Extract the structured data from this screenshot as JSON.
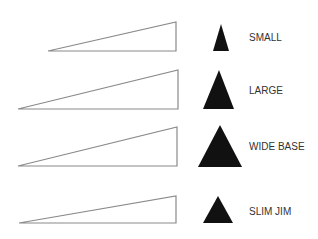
{
  "colors": {
    "background": "#ffffff",
    "outline_stroke": "#8a8a8a",
    "solid_fill": "#111111",
    "label_text": "#333333"
  },
  "rows": [
    {
      "label": "SMALL",
      "outline_triangle": {
        "points": "48,51 176,22 176,51"
      },
      "solid_triangle": {
        "points": "221,24 213,51 229,51"
      },
      "label_pos": {
        "x": 249,
        "y": 33
      }
    },
    {
      "label": "LARGE",
      "outline_triangle": {
        "points": "18,109 178,70 178,109"
      },
      "solid_triangle": {
        "points": "219,70 203,109 234,109"
      },
      "label_pos": {
        "x": 249,
        "y": 86
      }
    },
    {
      "label": "WIDE BASE",
      "outline_triangle": {
        "points": "18,166 177,127 177,166"
      },
      "solid_triangle": {
        "points": "220,125 198,167 242,167"
      },
      "label_pos": {
        "x": 249,
        "y": 142
      }
    },
    {
      "label": "SLIM JIM",
      "outline_triangle": {
        "points": "19,223 176,196 176,223"
      },
      "solid_triangle": {
        "points": "218,196 203,223 233,223"
      },
      "label_pos": {
        "x": 249,
        "y": 207
      }
    }
  ]
}
